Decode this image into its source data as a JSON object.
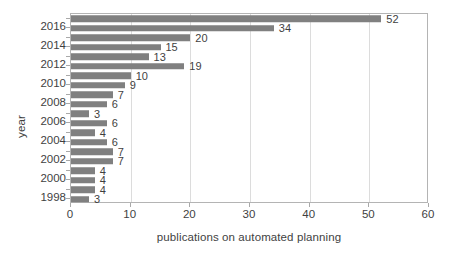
{
  "chart_data": {
    "type": "bar",
    "orientation": "horizontal",
    "title": "",
    "xlabel": "publications on automated planning",
    "ylabel": "year",
    "xlim": [
      0,
      60
    ],
    "ylim_categories": [
      "1998",
      "1999",
      "2000",
      "2001",
      "2002",
      "2003",
      "2004",
      "2005",
      "2006",
      "2007",
      "2008",
      "2009",
      "2010",
      "2011",
      "2012",
      "2013",
      "2014",
      "2015",
      "2016",
      "2017"
    ],
    "categories": [
      "2017",
      "2016",
      "2015",
      "2014",
      "2013",
      "2012",
      "2011",
      "2010",
      "2009",
      "2008",
      "2007",
      "2006",
      "2005",
      "2004",
      "2003",
      "2002",
      "2001",
      "2000",
      "1999",
      "1998"
    ],
    "values": [
      52,
      34,
      20,
      15,
      13,
      19,
      10,
      9,
      7,
      6,
      3,
      6,
      4,
      6,
      7,
      7,
      4,
      4,
      4,
      3
    ],
    "bars": [
      {
        "category": "2017",
        "value": 52,
        "label": "52"
      },
      {
        "category": "2016",
        "value": 34,
        "label": "34"
      },
      {
        "category": "2015",
        "value": 20,
        "label": "20"
      },
      {
        "category": "2014",
        "value": 15,
        "label": "15"
      },
      {
        "category": "2013",
        "value": 13,
        "label": "13"
      },
      {
        "category": "2012",
        "value": 19,
        "label": "19"
      },
      {
        "category": "2011",
        "value": 10,
        "label": "10"
      },
      {
        "category": "2010",
        "value": 9,
        "label": "9"
      },
      {
        "category": "2009",
        "value": 7,
        "label": "7"
      },
      {
        "category": "2008",
        "value": 6,
        "label": "6"
      },
      {
        "category": "2007",
        "value": 3,
        "label": "3"
      },
      {
        "category": "2006",
        "value": 6,
        "label": "6"
      },
      {
        "category": "2005",
        "value": 4,
        "label": "4"
      },
      {
        "category": "2004",
        "value": 6,
        "label": "6"
      },
      {
        "category": "2003",
        "value": 7,
        "label": "7"
      },
      {
        "category": "2002",
        "value": 7,
        "label": "7"
      },
      {
        "category": "2001",
        "value": 4,
        "label": "4"
      },
      {
        "category": "2000",
        "value": 4,
        "label": "4"
      },
      {
        "category": "1999",
        "value": 4,
        "label": "4"
      },
      {
        "category": "1998",
        "value": 3,
        "label": "3"
      }
    ],
    "x_ticks": [
      {
        "value": 0,
        "label": "0"
      },
      {
        "value": 10,
        "label": "10"
      },
      {
        "value": 20,
        "label": "20"
      },
      {
        "value": 30,
        "label": "30"
      },
      {
        "value": 40,
        "label": "40"
      },
      {
        "value": 50,
        "label": "50"
      },
      {
        "value": 60,
        "label": "60"
      }
    ],
    "y_ticks_visible": [
      {
        "category": "2016",
        "label": "2016"
      },
      {
        "category": "2014",
        "label": "2014"
      },
      {
        "category": "2012",
        "label": "2012"
      },
      {
        "category": "2010",
        "label": "2010"
      },
      {
        "category": "2008",
        "label": "2008"
      },
      {
        "category": "2006",
        "label": "2006"
      },
      {
        "category": "2004",
        "label": "2004"
      },
      {
        "category": "2002",
        "label": "2002"
      },
      {
        "category": "2000",
        "label": "2000"
      },
      {
        "category": "1998",
        "label": "1998"
      }
    ],
    "grid": {
      "vertical": true,
      "horizontal": false
    },
    "legend": null,
    "colors": {
      "bar": "#808080",
      "gridline": "#dcdcdc",
      "axis_border": "#b4b4b4",
      "text": "#3f3f3f",
      "background": "#ffffff"
    }
  }
}
